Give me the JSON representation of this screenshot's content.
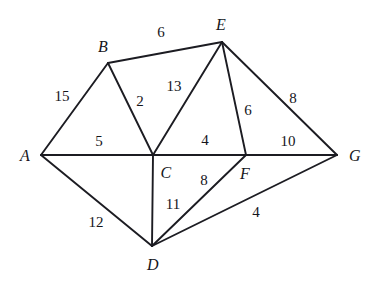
{
  "chart_data": {
    "type": "diagram",
    "title": "",
    "subtitle": "",
    "background_color": "#ffffff",
    "edge_color": "#1c1c22",
    "text_color": "#15151a",
    "nodes": [
      {
        "id": "A",
        "label": "A",
        "x": 41,
        "y": 155,
        "label_x": 25,
        "label_y": 156
      },
      {
        "id": "B",
        "label": "B",
        "x": 108,
        "y": 63,
        "label_x": 103,
        "label_y": 47
      },
      {
        "id": "C",
        "label": "C",
        "x": 153,
        "y": 155,
        "label_x": 166,
        "label_y": 173
      },
      {
        "id": "D",
        "label": "D",
        "x": 152,
        "y": 246,
        "label_x": 153,
        "label_y": 265
      },
      {
        "id": "E",
        "label": "E",
        "x": 222,
        "y": 42,
        "label_x": 221,
        "label_y": 25
      },
      {
        "id": "F",
        "label": "F",
        "x": 246,
        "y": 155,
        "label_x": 245,
        "label_y": 174
      },
      {
        "id": "G",
        "label": "G",
        "x": 337,
        "y": 155,
        "label_x": 355,
        "label_y": 156
      }
    ],
    "edges": [
      {
        "source": "A",
        "target": "B",
        "weight": 15,
        "label_x": 62,
        "label_y": 96
      },
      {
        "source": "A",
        "target": "C",
        "weight": 5,
        "label_x": 99,
        "label_y": 141
      },
      {
        "source": "A",
        "target": "D",
        "weight": 12,
        "label_x": 96,
        "label_y": 222
      },
      {
        "source": "B",
        "target": "C",
        "weight": 2,
        "label_x": 140,
        "label_y": 101
      },
      {
        "source": "B",
        "target": "E",
        "weight": 6,
        "label_x": 161,
        "label_y": 32
      },
      {
        "source": "C",
        "target": "E",
        "weight": 13,
        "label_x": 174,
        "label_y": 86
      },
      {
        "source": "C",
        "target": "F",
        "weight": 4,
        "label_x": 205,
        "label_y": 140
      },
      {
        "source": "C",
        "target": "D",
        "weight": 11,
        "label_x": 173,
        "label_y": 204
      },
      {
        "source": "D",
        "target": "F",
        "weight": 8,
        "label_x": 204,
        "label_y": 180
      },
      {
        "source": "D",
        "target": "G",
        "weight": 4,
        "label_x": 256,
        "label_y": 212
      },
      {
        "source": "E",
        "target": "F",
        "weight": 6,
        "label_x": 248,
        "label_y": 110
      },
      {
        "source": "E",
        "target": "G",
        "weight": 8,
        "label_x": 293,
        "label_y": 98
      },
      {
        "source": "F",
        "target": "G",
        "weight": 10,
        "label_x": 288,
        "label_y": 141
      }
    ]
  }
}
